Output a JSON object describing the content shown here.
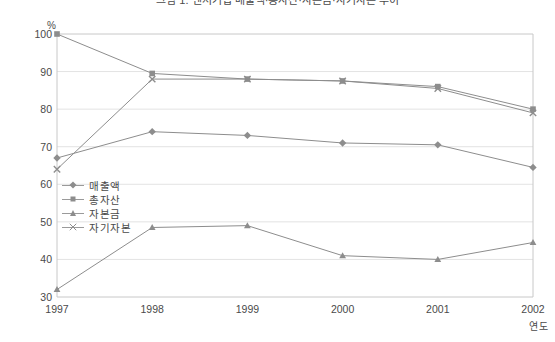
{
  "chart_data": {
    "type": "line",
    "title": "그림 1. 벤처기업 매출액·총자산·자본금·자기자본 추이",
    "xlabel": "연도",
    "ylabel": "%",
    "categories": [
      "1997",
      "1998",
      "1999",
      "2000",
      "2001",
      "2002"
    ],
    "xlim": [
      1997,
      2002
    ],
    "ylim": [
      30,
      100
    ],
    "ytick_step": 10,
    "yticks": [
      "100",
      "90",
      "80",
      "70",
      "60",
      "50",
      "40",
      "30"
    ],
    "grid": "horizontal",
    "legend_position": "inside-left",
    "series": [
      {
        "name": "매출액",
        "marker": "diamond",
        "color": "#8d8d8d",
        "values": [
          67,
          74,
          73,
          71,
          70.5,
          64.5
        ]
      },
      {
        "name": "총자산",
        "marker": "square",
        "color": "#8d8d8d",
        "values": [
          100,
          89.5,
          88,
          87.5,
          86,
          80
        ]
      },
      {
        "name": "자본금",
        "marker": "triangle",
        "color": "#8d8d8d",
        "values": [
          32,
          48.5,
          49,
          41,
          40,
          44.5
        ]
      },
      {
        "name": "자기자본",
        "marker": "x",
        "color": "#8d8d8d",
        "values": [
          64,
          88,
          88,
          87.5,
          85.5,
          79
        ]
      }
    ]
  },
  "colors": {
    "line": "#8d8d8d",
    "grid": "#e3e3e3",
    "frame": "#c8c8c8",
    "text": "#4a4a4a"
  }
}
